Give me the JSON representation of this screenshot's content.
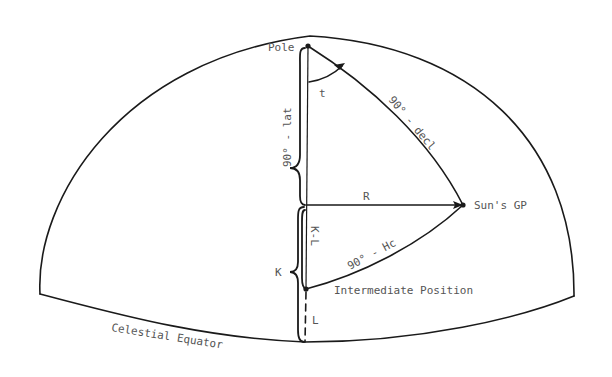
{
  "diagram": {
    "type": "celestial-navigation-spherical-triangle",
    "labels": {
      "pole": "Pole",
      "t": "t",
      "colat": "90° - lat",
      "codec": "90° - decl",
      "r": "R",
      "suns_gp": "Sun's GP",
      "k_minus_l": "K-L",
      "coalt": "90° - Hc",
      "k": "K",
      "intermediate": "Intermediate Position",
      "l": "L",
      "equator": "Celestial Equator"
    },
    "points": {
      "pole": [
        308,
        46
      ],
      "suns_gp": [
        463,
        205
      ],
      "r_foot": [
        307,
        205
      ],
      "intermediate": [
        306,
        289
      ],
      "equator_foot": [
        305,
        342
      ]
    },
    "colors": {
      "stroke": "#1a1a1a",
      "text": "#555555",
      "background": "#ffffff"
    }
  }
}
